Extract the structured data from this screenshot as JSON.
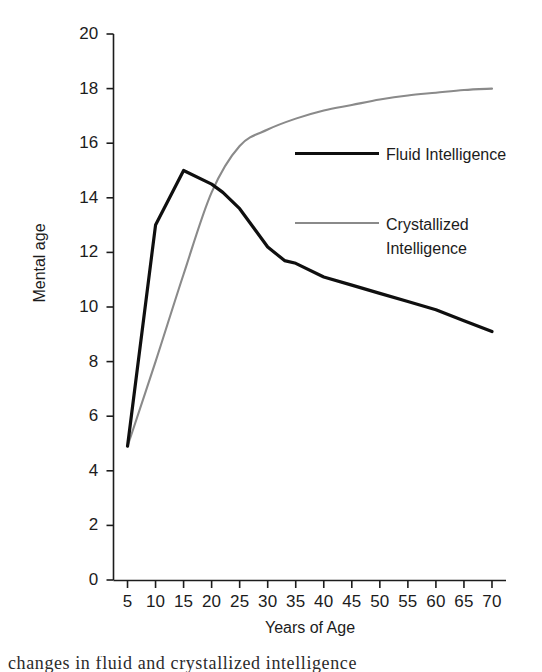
{
  "chart_data": {
    "type": "line",
    "title": "",
    "xlabel": "Years of Age",
    "ylabel": "Mental age",
    "xlim": [
      2.5,
      72.5
    ],
    "ylim": [
      0,
      20
    ],
    "grid": false,
    "legend_position": "inside-right",
    "x_ticks": [
      5,
      10,
      15,
      20,
      25,
      30,
      35,
      40,
      45,
      50,
      55,
      60,
      65,
      70
    ],
    "x_tick_labels": [
      "5",
      "10",
      "15",
      "20",
      "25",
      "30",
      "35",
      "40",
      "45",
      "50",
      "55",
      "60",
      "65",
      "70"
    ],
    "y_ticks": [
      0,
      2,
      4,
      6,
      8,
      10,
      12,
      14,
      16,
      18,
      20
    ],
    "y_tick_labels": [
      "0",
      "2",
      "4",
      "6",
      "8",
      "10",
      "12",
      "14",
      "16",
      "18",
      "20"
    ],
    "series": [
      {
        "name": "Fluid Intelligence",
        "color": "#0f0f0f",
        "width": 3.2,
        "x": [
          5,
          10,
          15,
          20,
          22,
          25,
          30,
          33,
          35,
          40,
          45,
          50,
          55,
          60,
          65,
          70
        ],
        "values": [
          4.9,
          13.0,
          15.0,
          14.5,
          14.2,
          13.6,
          12.2,
          11.7,
          11.6,
          11.1,
          10.8,
          10.5,
          10.2,
          9.9,
          9.5,
          9.1
        ]
      },
      {
        "name": "Crystallized Intelligence",
        "color": "#8a8a8a",
        "width": 2.1,
        "x": [
          5,
          10,
          15,
          20,
          25,
          30,
          35,
          40,
          45,
          50,
          55,
          60,
          65,
          70
        ],
        "values": [
          4.9,
          8.0,
          11.2,
          14.2,
          15.9,
          16.5,
          16.9,
          17.2,
          17.4,
          17.6,
          17.75,
          17.85,
          17.95,
          18.0
        ]
      }
    ]
  },
  "legend": {
    "items": [
      {
        "label": "Fluid Intelligence",
        "color": "#0f0f0f",
        "style": "solid-dark"
      },
      {
        "label": "Crystallized\nIntelligence",
        "color": "#8a8a8a",
        "style": "solid-gray"
      }
    ]
  },
  "axes": {
    "y_title": "Mental age",
    "x_title": "Years of Age"
  },
  "caption": {
    "text": "changes in fluid and crystallized intelligence"
  }
}
